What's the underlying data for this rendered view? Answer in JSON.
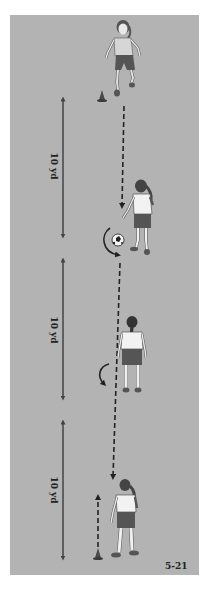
{
  "diagram": {
    "figure_number": "5-21",
    "field_color": "#b3b3b3",
    "distance_labels": [
      {
        "text": "10 yd"
      },
      {
        "text": "10 yd"
      },
      {
        "text": "10 yd"
      }
    ],
    "elements": {
      "players": [
        {
          "id": "player-top",
          "description": "player running toward camera"
        },
        {
          "id": "player-middle-upper",
          "description": "player with ball, turning"
        },
        {
          "id": "player-middle-lower",
          "description": "player standing, back view"
        },
        {
          "id": "player-bottom",
          "description": "player standing near cone"
        }
      ],
      "cones": [
        {
          "id": "cone-top"
        },
        {
          "id": "cone-bottom"
        }
      ],
      "ball": {
        "id": "soccer-ball"
      }
    }
  }
}
